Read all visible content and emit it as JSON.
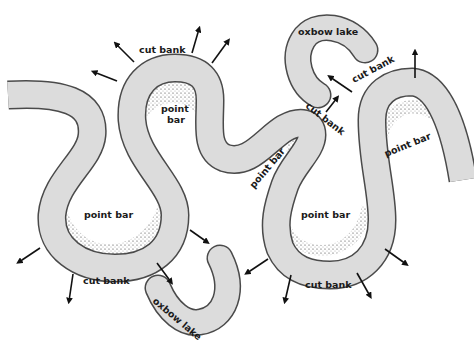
{
  "diagram": {
    "colors": {
      "river_fill": "#dcdcdc",
      "river_outline": "#4a4a4a",
      "background": "#ffffff",
      "text": "#1a1a1a",
      "arrow": "#111111"
    },
    "labels": {
      "cut_bank_top": "cut bank",
      "point_bar_top": "point",
      "point_bar_top_line2": "bar",
      "point_bar_left": "point bar",
      "cut_bank_bottom_left": "cut bank",
      "oxbow_lake_bottom": "oxbow lake",
      "oxbow_lake_top": "oxbow lake",
      "cut_bank_top_right": "cut bank",
      "cut_bank_middle": "cut bank",
      "point_bar_middle": "point bar",
      "point_bar_center": "point bar",
      "point_bar_right": "point bar",
      "cut_bank_bottom_right": "cut bank"
    },
    "legend_semantics": {
      "arrows": "direction of cut bank erosion",
      "stippled_areas": "point bar deposits",
      "gray_band": "river channel"
    }
  }
}
